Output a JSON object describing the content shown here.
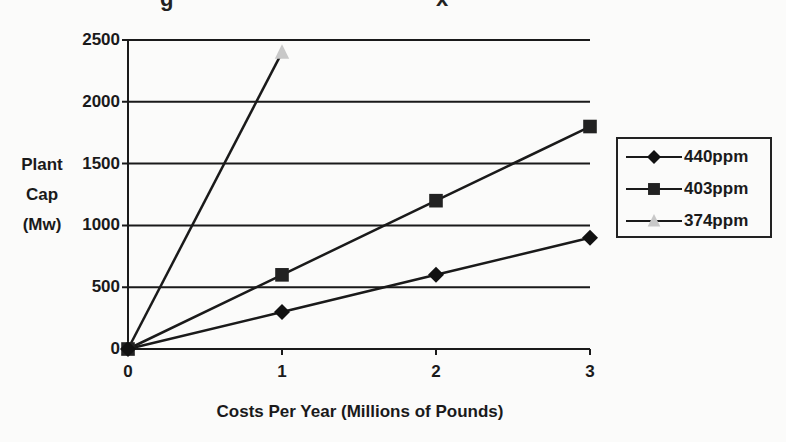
{
  "title_fragments": [
    {
      "text": "g",
      "x": 160
    },
    {
      "text": "x",
      "x": 436
    }
  ],
  "chart_data": {
    "type": "line",
    "xlabel": "Costs Per Year (Millions of Pounds)",
    "ylabel": "Plant Cap (Mw)",
    "ylabel_lines": [
      "Plant",
      "Cap",
      "(Mw)"
    ],
    "x_ticks": [
      "0",
      "1",
      "2",
      "3"
    ],
    "y_ticks": [
      "0",
      "500",
      "1000",
      "1500",
      "2000",
      "2500"
    ],
    "xlim": [
      0,
      3
    ],
    "ylim": [
      0,
      2500
    ],
    "grid": "horizontal",
    "legend_position": "right",
    "series": [
      {
        "name": "440ppm",
        "marker": "diamond",
        "color": "#111111",
        "x": [
          0,
          1,
          2,
          3
        ],
        "values": [
          0,
          300,
          600,
          900
        ]
      },
      {
        "name": "403ppm",
        "marker": "square",
        "color": "#222222",
        "x": [
          0,
          1,
          2,
          3
        ],
        "values": [
          0,
          600,
          1200,
          1800
        ]
      },
      {
        "name": "374ppm",
        "marker": "triangle",
        "color": "#c8c8c8",
        "x": [
          0,
          1
        ],
        "values": [
          0,
          2400
        ]
      }
    ]
  }
}
